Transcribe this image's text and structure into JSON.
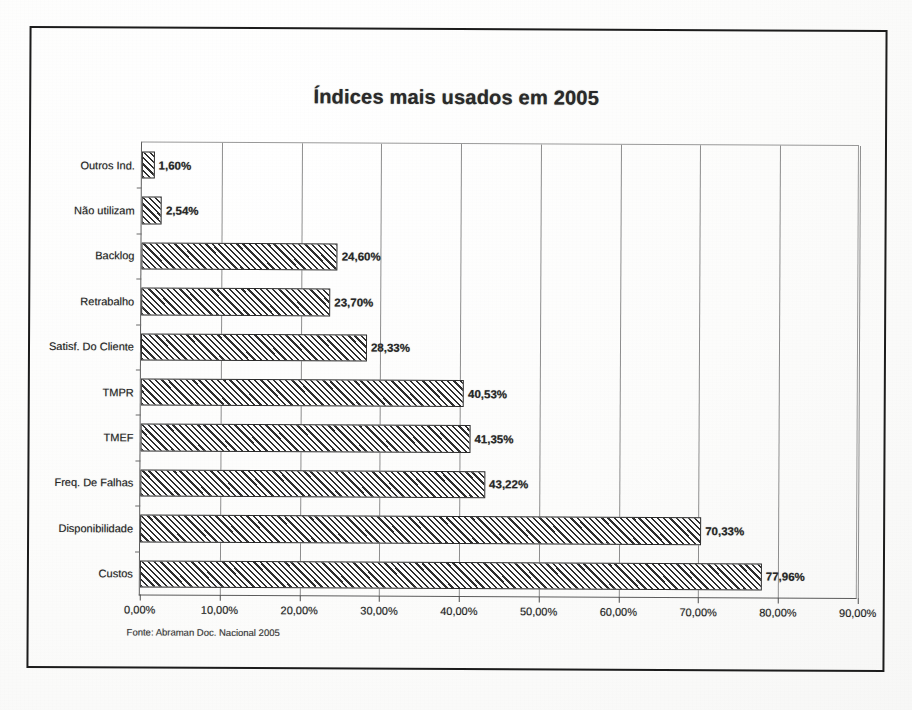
{
  "figure": {
    "source_note": "Fonte: Abraman Doc. Nacional 2005",
    "frame_color": "#1c1c1c",
    "bar_hatch_color": "#2e2e2e",
    "bar_fill_color": "#fdfdfd"
  },
  "chart_data": {
    "type": "bar",
    "orientation": "horizontal",
    "title": "Índices mais usados em 2005",
    "xlabel": "",
    "ylabel": "",
    "xlim": [
      0,
      90
    ],
    "grid": true,
    "legend": false,
    "categories": [
      "Outros Ind.",
      "Não utilizam",
      "Backlog",
      "Retrabalho",
      "Satisf. Do Cliente",
      "TMPR",
      "TMEF",
      "Freq. De Falhas",
      "Disponibilidade",
      "Custos"
    ],
    "values": [
      1.6,
      2.54,
      24.6,
      23.7,
      28.33,
      40.53,
      41.35,
      43.22,
      70.33,
      77.96
    ],
    "value_labels": [
      "1,60%",
      "2,54%",
      "24,60%",
      "23,70%",
      "28,33%",
      "40,53%",
      "41,35%",
      "43,22%",
      "70,33%",
      "77,96%"
    ],
    "xticks": [
      0,
      10,
      20,
      30,
      40,
      50,
      60,
      70,
      80,
      90
    ],
    "xtick_labels": [
      "0,00%",
      "10,00%",
      "20,00%",
      "30,00%",
      "40,00%",
      "50,00%",
      "60,00%",
      "70,00%",
      "80,00%",
      "90,00%"
    ]
  }
}
